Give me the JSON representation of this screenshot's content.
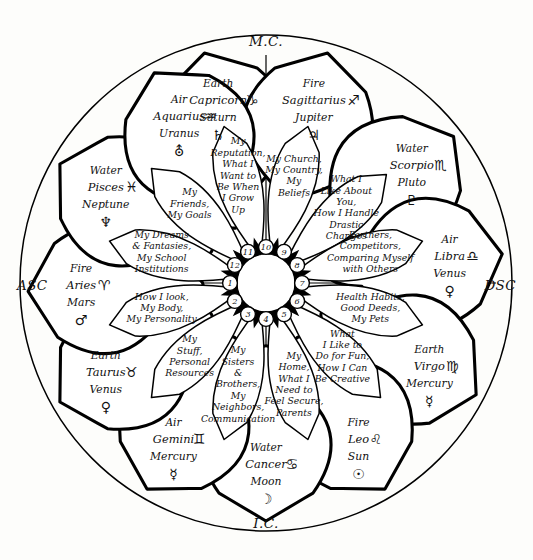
{
  "figure": {
    "accent_color": "#000000",
    "background_color": "#fdfdfb"
  },
  "axes": {
    "mc": "M.C.",
    "ic": "I.C.",
    "asc": "ASC",
    "dsc": "DSC"
  },
  "center": {
    "numbers": [
      "1",
      "2",
      "3",
      "4",
      "5",
      "6",
      "7",
      "8",
      "9",
      "10",
      "11",
      "12"
    ]
  },
  "signs": [
    {
      "house": "10",
      "element": "Earth",
      "sign": "Capricorn",
      "sign_glyph": "♑",
      "ruler": "Saturn",
      "ruler_glyph": "♄",
      "glyph_name": "capricorn-glyph",
      "ruler_glyph_name": "saturn-glyph"
    },
    {
      "house": "9",
      "element": "Fire",
      "sign": "Sagittarius",
      "sign_glyph": "♐",
      "ruler": "Jupiter",
      "ruler_glyph": "♃",
      "glyph_name": "sagittarius-glyph",
      "ruler_glyph_name": "jupiter-glyph"
    },
    {
      "house": "8",
      "element": "Water",
      "sign": "Scorpio",
      "sign_glyph": "♏",
      "ruler": "Pluto",
      "ruler_glyph": "♇",
      "glyph_name": "scorpio-glyph",
      "ruler_glyph_name": "pluto-glyph"
    },
    {
      "house": "7",
      "element": "Air",
      "sign": "Libra",
      "sign_glyph": "♎",
      "ruler": "Venus",
      "ruler_glyph": "♀",
      "glyph_name": "libra-glyph",
      "ruler_glyph_name": "venus-glyph"
    },
    {
      "house": "6",
      "element": "Earth",
      "sign": "Virgo",
      "sign_glyph": "♍",
      "ruler": "Mercury",
      "ruler_glyph": "☿",
      "glyph_name": "virgo-glyph",
      "ruler_glyph_name": "mercury-glyph"
    },
    {
      "house": "5",
      "element": "Fire",
      "sign": "Leo",
      "sign_glyph": "♌",
      "ruler": "Sun",
      "ruler_glyph": "☉",
      "glyph_name": "leo-glyph",
      "ruler_glyph_name": "sun-glyph"
    },
    {
      "house": "4",
      "element": "Water",
      "sign": "Cancer",
      "sign_glyph": "♋",
      "ruler": "Moon",
      "ruler_glyph": "☽",
      "glyph_name": "cancer-glyph",
      "ruler_glyph_name": "moon-glyph"
    },
    {
      "house": "3",
      "element": "Air",
      "sign": "Gemini",
      "sign_glyph": "♊",
      "ruler": "Mercury",
      "ruler_glyph": "☿",
      "glyph_name": "gemini-glyph",
      "ruler_glyph_name": "mercury-glyph"
    },
    {
      "house": "2",
      "element": "Earth",
      "sign": "Taurus",
      "sign_glyph": "♉",
      "ruler": "Venus",
      "ruler_glyph": "♀",
      "glyph_name": "taurus-glyph",
      "ruler_glyph_name": "venus-glyph"
    },
    {
      "house": "1",
      "element": "Fire",
      "sign": "Aries",
      "sign_glyph": "♈",
      "ruler": "Mars",
      "ruler_glyph": "♂",
      "glyph_name": "aries-glyph",
      "ruler_glyph_name": "mars-glyph"
    },
    {
      "house": "12",
      "element": "Water",
      "sign": "Pisces",
      "sign_glyph": "♓",
      "ruler": "Neptune",
      "ruler_glyph": "♆",
      "glyph_name": "pisces-glyph",
      "ruler_glyph_name": "neptune-glyph"
    },
    {
      "house": "11",
      "element": "Air",
      "sign": "Aquarius",
      "sign_glyph": "♒",
      "ruler": "Uranus",
      "ruler_glyph": "⛢",
      "glyph_name": "aquarius-glyph",
      "ruler_glyph_name": "uranus-glyph"
    }
  ],
  "houses": [
    {
      "number": "10",
      "lines": [
        "My",
        "Reputation,",
        "What I",
        "Want to",
        "Be When",
        "I Grow",
        "Up"
      ]
    },
    {
      "number": "9",
      "lines": [
        "My Church,",
        "My Country,",
        "My",
        "Beliefs"
      ]
    },
    {
      "number": "8",
      "lines": [
        "What I",
        "Like About",
        "You,",
        "How I Handle",
        "Drastic",
        "Changes"
      ]
    },
    {
      "number": "7",
      "lines": [
        "Partners,",
        "Competitors,",
        "Comparing Myself",
        "with Others"
      ]
    },
    {
      "number": "6",
      "lines": [
        "Health Habits,",
        "Good Deeds,",
        "My Pets"
      ]
    },
    {
      "number": "5",
      "lines": [
        "What",
        "I Like to",
        "Do for Fun,",
        "How I Can",
        "Be Creative"
      ]
    },
    {
      "number": "4",
      "lines": [
        "My",
        "Home,",
        "What I",
        "Need to",
        "Feel Secure,",
        "Parents"
      ]
    },
    {
      "number": "3",
      "lines": [
        "My",
        "Sisters",
        "&",
        "Brothers,",
        "My",
        "Neighbors,",
        "Communication"
      ]
    },
    {
      "number": "2",
      "lines": [
        "My",
        "Stuff,",
        "Personal",
        "Resources"
      ]
    },
    {
      "number": "1",
      "lines": [
        "How I look,",
        "My Body,",
        "My Personality"
      ]
    },
    {
      "number": "12",
      "lines": [
        "My Dreams",
        "& Fantasies,",
        "My School",
        "Institutions"
      ]
    },
    {
      "number": "11",
      "lines": [
        "My",
        "Friends,",
        "My Goals"
      ]
    }
  ]
}
